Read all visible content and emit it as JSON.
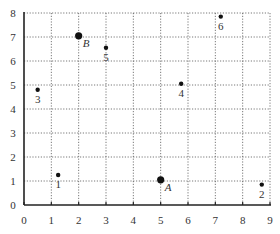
{
  "chart_data": {
    "type": "scatter",
    "title": "",
    "xlabel": "",
    "ylabel": "",
    "xlim": [
      0,
      9
    ],
    "ylim": [
      0,
      8
    ],
    "grid": true,
    "x_ticks": [
      "0",
      "1",
      "2",
      "3",
      "4",
      "5",
      "6",
      "7",
      "8",
      "9"
    ],
    "y_ticks": [
      "0",
      "1",
      "2",
      "3",
      "4",
      "5",
      "6",
      "7",
      "8"
    ],
    "series": [
      {
        "name": "numbered points",
        "marker": "small-dot",
        "points": [
          {
            "label": "1",
            "x": 1.25,
            "y": 1.25
          },
          {
            "label": "2",
            "x": 8.7,
            "y": 0.85
          },
          {
            "label": "3",
            "x": 0.5,
            "y": 4.8
          },
          {
            "label": "4",
            "x": 5.75,
            "y": 5.05
          },
          {
            "label": "5",
            "x": 3.0,
            "y": 6.55
          },
          {
            "label": "6",
            "x": 7.2,
            "y": 7.85
          }
        ]
      },
      {
        "name": "lettered points",
        "marker": "large-dot",
        "points": [
          {
            "label": "A",
            "x": 5.0,
            "y": 1.05
          },
          {
            "label": "B",
            "x": 2.0,
            "y": 7.05
          }
        ]
      }
    ]
  },
  "colors": {
    "marker": "#111111",
    "grid": "#555555",
    "axis": "#222222",
    "text": "#333333"
  }
}
